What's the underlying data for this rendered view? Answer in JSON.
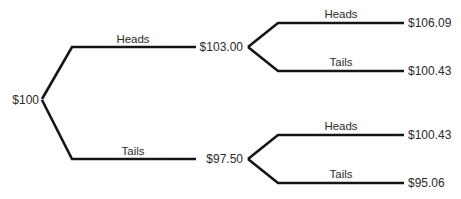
{
  "diagram": {
    "type": "binomial-tree",
    "background_color": "#ffffff",
    "line_color": "#151515",
    "text_color": "#2b2b2b"
  },
  "nodes": {
    "root": {
      "label": "$100",
      "x": 39,
      "y": 100
    },
    "up": {
      "label": "$103.00",
      "x": 243,
      "y": 47
    },
    "down": {
      "label": "$97.50",
      "x": 243,
      "y": 159
    },
    "up_up": {
      "label": "$106.09",
      "x": 408,
      "y": 23
    },
    "up_down": {
      "label": "$100.43",
      "x": 408,
      "y": 71
    },
    "down_up": {
      "label": "$100.43",
      "x": 408,
      "y": 135
    },
    "down_down": {
      "label": "$95.06",
      "x": 408,
      "y": 183
    }
  },
  "edge_labels": {
    "root_up": {
      "label": "Heads",
      "x": 133,
      "y": 39
    },
    "root_down": {
      "label": "Tails",
      "x": 133,
      "y": 151
    },
    "up_up": {
      "label": "Heads",
      "x": 341,
      "y": 14
    },
    "up_down": {
      "label": "Tails",
      "x": 341,
      "y": 62
    },
    "down_up": {
      "label": "Heads",
      "x": 341,
      "y": 126
    },
    "down_down": {
      "label": "Tails",
      "x": 341,
      "y": 174
    }
  },
  "edges": {
    "root_up": "M42,99 L72,47 L196,47",
    "root_down": "M42,100 L72,159 L196,159",
    "up_up": "M248,47 L278,23 L404,23",
    "up_down": "M248,47 L278,71 L404,71",
    "down_up": "M248,159 L278,135 L404,135",
    "down_down": "M248,159 L278,183 L404,183"
  }
}
